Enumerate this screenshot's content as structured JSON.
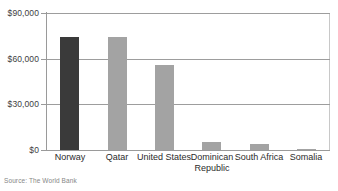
{
  "chart_data": {
    "type": "bar",
    "title": "",
    "subtitle": "",
    "xlabel": "",
    "ylabel": "",
    "categories": [
      "Norway",
      "Qatar",
      "United States",
      "Dominican Republic",
      "South Africa",
      "Somalia"
    ],
    "values": [
      74500,
      74500,
      56000,
      5000,
      4000,
      300
    ],
    "ylim": [
      0,
      90000
    ],
    "ytick_values": [
      0,
      30000,
      60000,
      90000
    ],
    "ytick_labels": [
      "$0",
      "$30,000",
      "$60,000",
      "$90,000"
    ],
    "grid": true,
    "legend": "none",
    "bar_colors": [
      "#3a3a3a",
      "#a3a3a3",
      "#a3a3a3",
      "#a3a3a3",
      "#a3a3a3",
      "#a3a3a3"
    ],
    "highlight_category": "Norway",
    "source": "Source: The World Bank"
  },
  "axis": {
    "ticks": [
      {
        "label": "$90,000",
        "value": 90000
      },
      {
        "label": "$60,000",
        "value": 60000
      },
      {
        "label": "$30,000",
        "value": 30000
      },
      {
        "label": "$0",
        "value": 0
      }
    ]
  },
  "categories": [
    {
      "label": "Norway"
    },
    {
      "label": "Qatar"
    },
    {
      "label": "United States"
    },
    {
      "label": "Dominican Republic"
    },
    {
      "label": "South Africa"
    },
    {
      "label": "Somalia"
    }
  ],
  "footer": {
    "source": "Source: The World Bank"
  },
  "colors": {
    "highlight_bar": "#3a3a3a",
    "default_bar": "#a3a3a3",
    "gridline": "#9d9d9d",
    "axis": "#9a9a9a",
    "text": "#2b2b2b",
    "source_text": "#868686"
  }
}
